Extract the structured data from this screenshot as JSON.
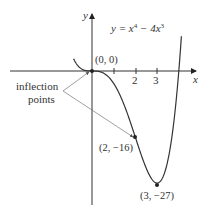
{
  "chart_data": {
    "type": "line",
    "equation_label": {
      "y": "y",
      "eq": " = x",
      "p1": "4",
      "mid": " − 4x",
      "p2": "3"
    },
    "xlabel": "x",
    "ylabel": "y",
    "x_ticks": [
      1,
      2,
      3
    ],
    "x_tick_labels": [
      "2",
      "3"
    ],
    "xlim": [
      -1.2,
      4.3
    ],
    "ylim": [
      -30,
      17
    ],
    "grid": false,
    "points": [
      {
        "x": 0,
        "y": 0,
        "label": "(0, 0)"
      },
      {
        "x": 2,
        "y": -16,
        "label": "(2, −16)"
      },
      {
        "x": 3,
        "y": -27,
        "label": "(3, −27)"
      }
    ],
    "annotation": {
      "line1": "inflection",
      "line2": "points",
      "targets": [
        [
          0,
          0
        ],
        [
          2,
          -16
        ]
      ]
    },
    "series": [
      {
        "name": "y = x^4 − 4x^3",
        "function": "x^4 - 4x^3",
        "x_range": [
          -0.85,
          4.12
        ]
      }
    ]
  }
}
